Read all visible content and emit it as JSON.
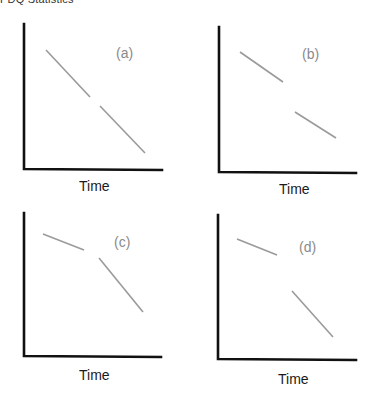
{
  "page": {
    "header_text": "PDQ Statistics"
  },
  "colors": {
    "axis": "#111111",
    "trend_line": "#9a9a9a",
    "panel_label": "#8a8a8a",
    "axis_title": "#1a1a1a",
    "background": "#ffffff"
  },
  "panels": [
    {
      "id": "a",
      "label": "(a)",
      "xlabel": "Time",
      "description": "Single continuous downward trend, small gap with no level change",
      "segments": [
        {
          "x1": 46,
          "y1": 50,
          "x2": 90,
          "y2": 97
        },
        {
          "x1": 100,
          "y1": 106,
          "x2": 145,
          "y2": 153
        }
      ]
    },
    {
      "id": "b",
      "label": "(b)",
      "xlabel": "Time",
      "description": "Same slope before and after, with a downward level shift",
      "segments": [
        {
          "x1": 240,
          "y1": 52,
          "x2": 283,
          "y2": 82
        },
        {
          "x1": 295,
          "y1": 112,
          "x2": 336,
          "y2": 138
        }
      ]
    },
    {
      "id": "c",
      "label": "(c)",
      "xlabel": "Time",
      "description": "Slope change (steeper decline) with no level shift",
      "segments": [
        {
          "x1": 43,
          "y1": 234,
          "x2": 84,
          "y2": 250
        },
        {
          "x1": 99,
          "y1": 258,
          "x2": 143,
          "y2": 312
        }
      ]
    },
    {
      "id": "d",
      "label": "(d)",
      "xlabel": "Time",
      "description": "Both level drop and slope change",
      "segments": [
        {
          "x1": 237,
          "y1": 239,
          "x2": 277,
          "y2": 255
        },
        {
          "x1": 292,
          "y1": 291,
          "x2": 333,
          "y2": 337
        }
      ]
    }
  ],
  "chart_data": [
    {
      "type": "line",
      "title": "(a)",
      "xlabel": "Time",
      "ylabel": "",
      "grid": false,
      "series": [
        {
          "name": "before",
          "x": [
            0,
            0.46
          ],
          "y": [
            0.82,
            0.5
          ]
        },
        {
          "name": "after",
          "x": [
            0.54,
            0.88
          ],
          "y": [
            0.44,
            0.12
          ]
        }
      ]
    },
    {
      "type": "line",
      "title": "(b)",
      "xlabel": "Time",
      "ylabel": "",
      "grid": false,
      "series": [
        {
          "name": "before",
          "x": [
            0.15,
            0.46
          ],
          "y": [
            0.84,
            0.63
          ]
        },
        {
          "name": "after",
          "x": [
            0.55,
            0.85
          ],
          "y": [
            0.42,
            0.24
          ]
        }
      ]
    },
    {
      "type": "line",
      "title": "(c)",
      "xlabel": "Time",
      "ylabel": "",
      "grid": false,
      "series": [
        {
          "name": "before",
          "x": [
            0.14,
            0.44
          ],
          "y": [
            0.86,
            0.75
          ]
        },
        {
          "name": "after",
          "x": [
            0.55,
            0.87
          ],
          "y": [
            0.69,
            0.31
          ]
        }
      ]
    },
    {
      "type": "line",
      "title": "(d)",
      "xlabel": "Time",
      "ylabel": "",
      "grid": false,
      "series": [
        {
          "name": "before",
          "x": [
            0.14,
            0.43
          ],
          "y": [
            0.83,
            0.72
          ]
        },
        {
          "name": "after",
          "x": [
            0.53,
            0.83
          ],
          "y": [
            0.47,
            0.15
          ]
        }
      ]
    }
  ]
}
